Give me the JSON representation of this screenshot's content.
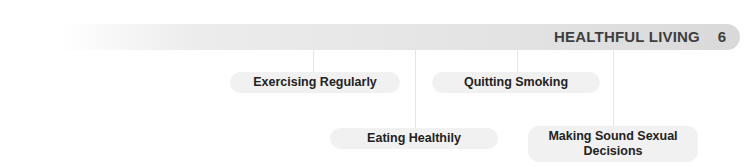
{
  "header": {
    "title": "HEALTHFUL LIVING",
    "chapter_number": "6"
  },
  "nodes": [
    {
      "label": "Exercising Regularly"
    },
    {
      "label": "Quitting Smoking"
    },
    {
      "label": "Eating Healthily"
    },
    {
      "label": "Making Sound Sexual Decisions"
    }
  ],
  "colors": {
    "header_bar": "#dcdcdc",
    "pill_bg": "#f1f1f1",
    "text": "#222222"
  }
}
